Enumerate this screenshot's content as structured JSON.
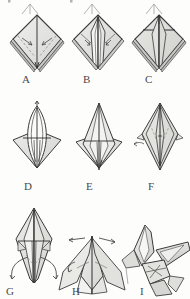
{
  "document": {
    "kind": "origami-instruction-diagram",
    "subject": "Paper crane (orizuru) folding sequence",
    "background_color": "#fdfdfc",
    "ink_color": "#3a3a3a",
    "shade_color": "#d8d8d6",
    "dashed_color": "#8a8a8a",
    "panel_count": 9
  },
  "steps": [
    {
      "id": "A",
      "label": "A",
      "caption": "Preliminary diamond with dashed valley folds marked toward the centre line",
      "shape": "diamond-kite",
      "label_x": 22,
      "label_y": 74
    },
    {
      "id": "B",
      "label": "B",
      "caption": "Front flaps folded in to the centre, forming narrow panels",
      "shape": "diamond-kite-folded",
      "label_x": 83,
      "label_y": 74
    },
    {
      "id": "C",
      "label": "C",
      "caption": "Top triangle creased down across the folded flaps",
      "shape": "diamond-crease",
      "label_x": 145,
      "label_y": 74
    },
    {
      "id": "D",
      "label": "D",
      "caption": "Petal fold opened up, top point lifted along the curved guide",
      "shape": "petal-open",
      "label_x": 24,
      "label_y": 181
    },
    {
      "id": "E",
      "label": "E",
      "caption": "Petal fold completed, front layer flattened upward",
      "shape": "petal-closed",
      "label_x": 86,
      "label_y": 181
    },
    {
      "id": "F",
      "label": "F",
      "caption": "Bird base seen from the side, flaps folded to the centre",
      "shape": "bird-base-narrow",
      "label_x": 148,
      "label_y": 181
    },
    {
      "id": "G",
      "label": "G",
      "caption": "Lower points swung outward to form the neck and tail",
      "shape": "legs-spread",
      "label_x": 6,
      "label_y": 286
    },
    {
      "id": "H",
      "label": "H",
      "caption": "Neck and tail reverse-folded out, wings opened",
      "shape": "neck-tail-out",
      "label_x": 72,
      "label_y": 286
    },
    {
      "id": "I",
      "label": "I",
      "caption": "Finished paper crane with head folded and wings spread",
      "shape": "finished-crane",
      "label_x": 140,
      "label_y": 286
    }
  ],
  "cropped_row": {
    "present": true,
    "note": "Bottom tips of a previous row of diagrams clipped at the top edge"
  }
}
